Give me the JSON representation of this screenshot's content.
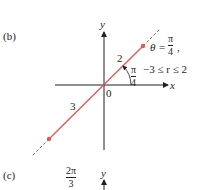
{
  "panel_b": {
    "label": "(b)",
    "axes": {
      "x_label": "x",
      "y_label": "y",
      "origin_label": "0"
    },
    "segment_labels": {
      "upper": "2",
      "lower": "3"
    },
    "angle": {
      "num": "π",
      "den": "4"
    },
    "equation": {
      "theta": "θ",
      "eq": "=",
      "num": "π",
      "den": "4",
      "comma": ",",
      "range": "−3 ≤ r ≤ 2"
    },
    "colors": {
      "ray": "#e05a5a",
      "axis": "#231f20"
    }
  },
  "panel_c": {
    "label": "(c)",
    "angle": {
      "num": "2π",
      "den": "3"
    },
    "y_label": "y"
  }
}
